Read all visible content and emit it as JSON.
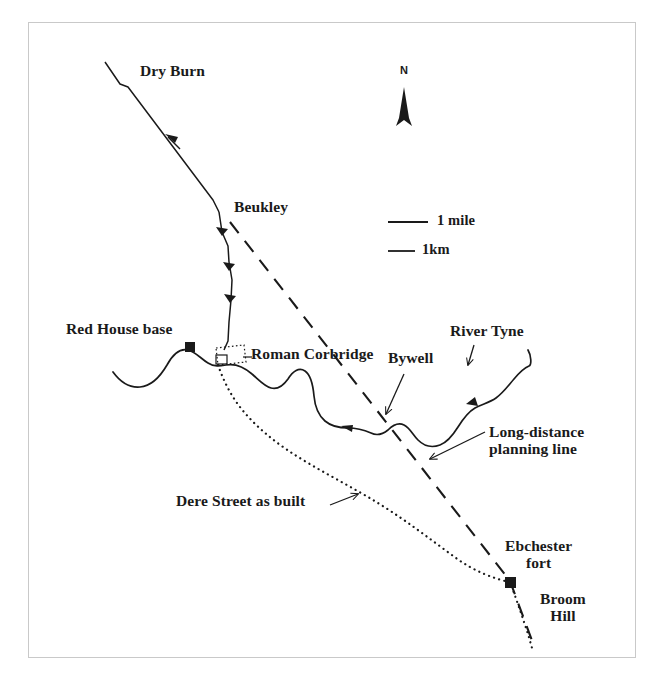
{
  "figure": {
    "kind": "archaeological-route-map",
    "frame_color": "#c9c9c9",
    "ink_color": "#1a1a1a",
    "background": "#ffffff"
  },
  "labels": {
    "dry_burn": "Dry Burn",
    "beukley": "Beukley",
    "red_house_base": "Red House base",
    "roman_corbridge": "Roman Corbridge",
    "bywell": "Bywell",
    "river_tyne": "River Tyne",
    "long_distance_planning_line_1": "Long-distance",
    "long_distance_planning_line_2": "planning line",
    "dere_street_as_built": "Dere Street as built",
    "ebchester_fort_1": "Ebchester",
    "ebchester_fort_2": "fort",
    "broom_hill_1": "Broom",
    "broom_hill_2": "Hill",
    "north": "N"
  },
  "scale_bars": [
    {
      "label": "1 mile",
      "length_px": 40
    },
    {
      "label": "1km",
      "length_px": 27
    }
  ],
  "markers": [
    {
      "name": "red-house-base-marker",
      "x": 190,
      "y": 347
    },
    {
      "name": "ebchester-fort-marker",
      "x": 510,
      "y": 582
    }
  ],
  "features": [
    {
      "name": "dry-burn-road",
      "style": "solid-with-arrows",
      "description": "Dere Street projected alignment from Dry Burn south to Red House base"
    },
    {
      "name": "long-distance-planning-line",
      "style": "dashed",
      "description": "Straight surveyed planning line from Beukley to Ebchester fort"
    },
    {
      "name": "river-tyne",
      "style": "solid-meander",
      "description": "River Tyne meandering west to east"
    },
    {
      "name": "dere-street-as-built",
      "style": "dotted",
      "description": "Actual constructed course of Dere Street"
    },
    {
      "name": "roman-corbridge-enclosure",
      "style": "dotted-rectangle",
      "description": "Roman Corbridge town outline"
    }
  ]
}
